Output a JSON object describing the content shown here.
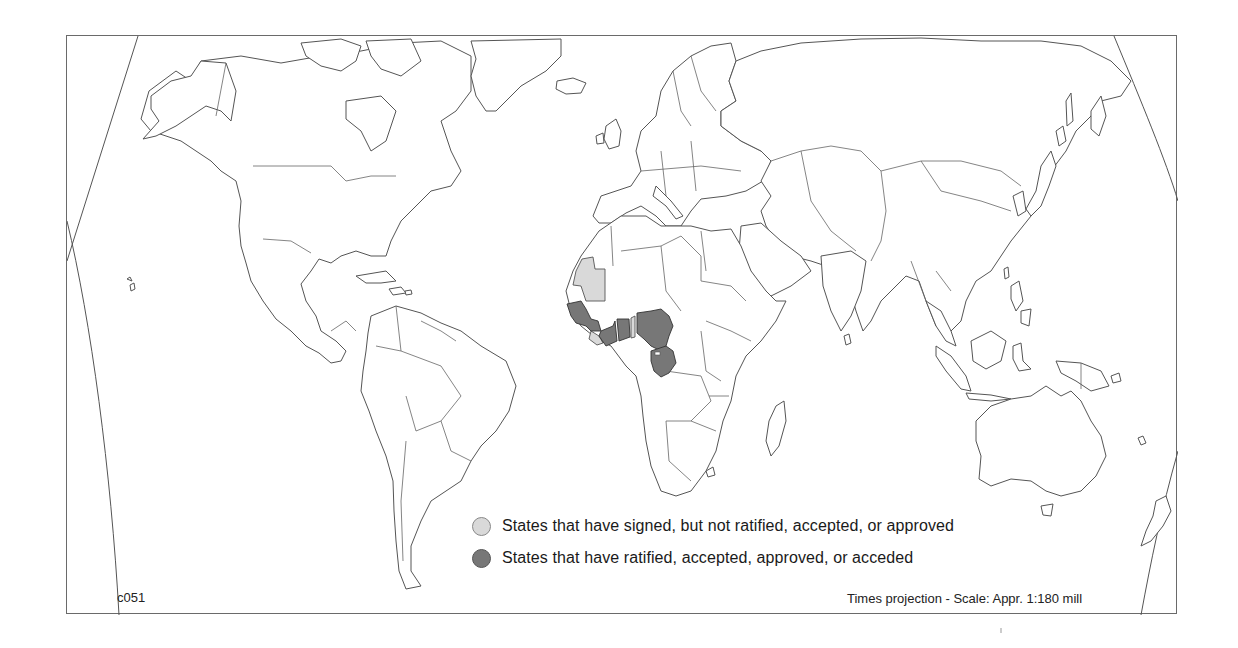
{
  "map": {
    "code": "c051",
    "projection_note": "Times projection - Scale: Appr. 1:180 mill",
    "legend": [
      {
        "key": "signed",
        "label": "States that have signed, but not ratified, accepted, or approved",
        "color": "#d9d9d9"
      },
      {
        "key": "ratified",
        "label": "States that have ratified, accepted, approved, or acceded",
        "color": "#777777"
      }
    ],
    "highlighted_regions": {
      "signed": [
        "Mauritania",
        "Guinea-Bissau/Sierra Leone area",
        "Togo"
      ],
      "ratified": [
        "Senegal",
        "Guinea",
        "Liberia",
        "Côte d'Ivoire",
        "Ghana",
        "Nigeria",
        "Cameroon",
        "Equatorial Guinea",
        "Gabon",
        "Congo"
      ]
    }
  }
}
